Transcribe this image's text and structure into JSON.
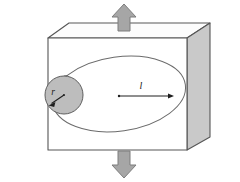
{
  "figure": {
    "name": "cylindrical-crack-in-block-under-tension",
    "background_color": "#ffffff",
    "labels": {
      "radius": "r",
      "length": "l"
    },
    "colors": {
      "outline": "#4d4d4d",
      "block_front_face": "#ffffff",
      "block_top_face": "#fbfbfb",
      "block_right_face": "#c9c9c9",
      "cylinder_body": "#c8c8c8",
      "cylinder_cap": "#bdbdbd",
      "crack_ellipse": "#ffffff",
      "arrow_fill": "#a6a6a6",
      "arrow_stroke": "#7a7a7a",
      "dimension_line": "#333333",
      "label_color": "#1a1a1a"
    },
    "elements": {
      "block": "rectangular-block-3d",
      "crack": "elliptical-crack-plane",
      "cylinder": "embedded-cylinder",
      "top_arrow": "tension-arrow-up",
      "bottom_arrow": "tension-arrow-down",
      "radius_dimension": "radius-arrow",
      "length_dimension": "semi-axis-arrow"
    },
    "geometry": {
      "block_front": "48,38 187,38 187,150 48,150",
      "block_top": "48,38 69,23 210,23 187,38",
      "block_right": "187,38 210,23 210,137 187,150",
      "crack_ellipse_center_x": 119,
      "crack_ellipse_center_y": 94,
      "crack_ellipse_rx": 67,
      "crack_ellipse_ry": 37,
      "crack_ellipse_rotation": -8,
      "cylinder_cap_center_x": 64,
      "cylinder_cap_center_y": 95,
      "cylinder_cap_r": 19,
      "length_arrow_from_x": 119,
      "length_arrow_to_x": 172,
      "length_arrow_y": 96,
      "radius_arrow_from_x": 64,
      "radius_arrow_from_y": 95,
      "radius_arrow_to_x": 50,
      "radius_arrow_to_y": 104,
      "top_arrow_x": 124,
      "top_arrow_top_y": 4,
      "top_arrow_bottom_y": 30,
      "bottom_arrow_x": 124,
      "bottom_arrow_top_y": 152,
      "bottom_arrow_bottom_y": 178,
      "label_r_x": 52,
      "label_r_y": 96,
      "label_l_x": 141,
      "label_l_y": 89
    }
  }
}
